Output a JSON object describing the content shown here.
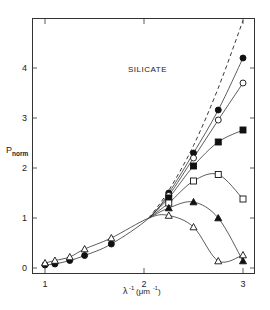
{
  "chart_data": {
    "type": "line",
    "title": "SILICATE",
    "xlabel": "λ⁻¹ (μm⁻¹)",
    "ylabel": "P_norm",
    "ylabel_main": "P",
    "ylabel_sub": "norm",
    "xlabel_main": "λ",
    "xlabel_sup": "-1",
    "xlabel_unit": "(μm",
    "xlabel_unit_sup": "-1",
    "xlabel_unit_close": ")",
    "xlim": [
      0.88,
      3.1
    ],
    "ylim": [
      -0.1,
      5.0
    ],
    "xticks": [
      1,
      2,
      3
    ],
    "xtick_labels": [
      "1",
      "2",
      "3"
    ],
    "yticks": [
      0,
      1,
      2,
      3,
      4
    ],
    "ytick_labels": [
      "0",
      "1",
      "2",
      "3",
      "4"
    ],
    "grid": false,
    "legend": null,
    "reference_curve": {
      "name": "dashed reference",
      "style": "dashed",
      "x": [
        2.05,
        2.25,
        2.5,
        2.75,
        3.0
      ],
      "y": [
        1.0,
        1.55,
        2.45,
        3.6,
        4.95
      ]
    },
    "series": [
      {
        "name": "filled-circle",
        "marker": "circle-filled",
        "x": [
          1.0,
          1.1,
          1.25,
          1.4,
          1.67,
          2.05,
          2.25,
          2.5,
          2.75,
          3.0
        ],
        "y": [
          0.06,
          0.08,
          0.15,
          0.25,
          0.48,
          1.0,
          1.5,
          2.3,
          3.16,
          4.2
        ]
      },
      {
        "name": "open-circle",
        "marker": "circle-open",
        "x": [
          2.05,
          2.25,
          2.5,
          2.75,
          3.0
        ],
        "y": [
          1.0,
          1.45,
          2.2,
          2.96,
          3.7
        ]
      },
      {
        "name": "filled-square",
        "marker": "square-filled",
        "x": [
          2.05,
          2.25,
          2.5,
          2.75,
          3.0
        ],
        "y": [
          1.0,
          1.4,
          2.04,
          2.52,
          2.76
        ]
      },
      {
        "name": "open-square",
        "marker": "square-open",
        "x": [
          2.05,
          2.25,
          2.5,
          2.75,
          3.0
        ],
        "y": [
          1.0,
          1.3,
          1.74,
          1.87,
          1.38
        ]
      },
      {
        "name": "filled-triangle",
        "marker": "triangle-filled",
        "x": [
          2.05,
          2.25,
          2.5,
          2.75,
          3.0
        ],
        "y": [
          1.0,
          1.2,
          1.32,
          1.0,
          0.14
        ]
      },
      {
        "name": "open-triangle",
        "marker": "triangle-open",
        "x": [
          1.0,
          1.1,
          1.25,
          1.4,
          1.67,
          2.05,
          2.25,
          2.5,
          2.75,
          3.0
        ],
        "y": [
          0.1,
          0.15,
          0.22,
          0.38,
          0.6,
          1.0,
          1.05,
          0.82,
          0.14,
          0.26
        ]
      }
    ]
  }
}
